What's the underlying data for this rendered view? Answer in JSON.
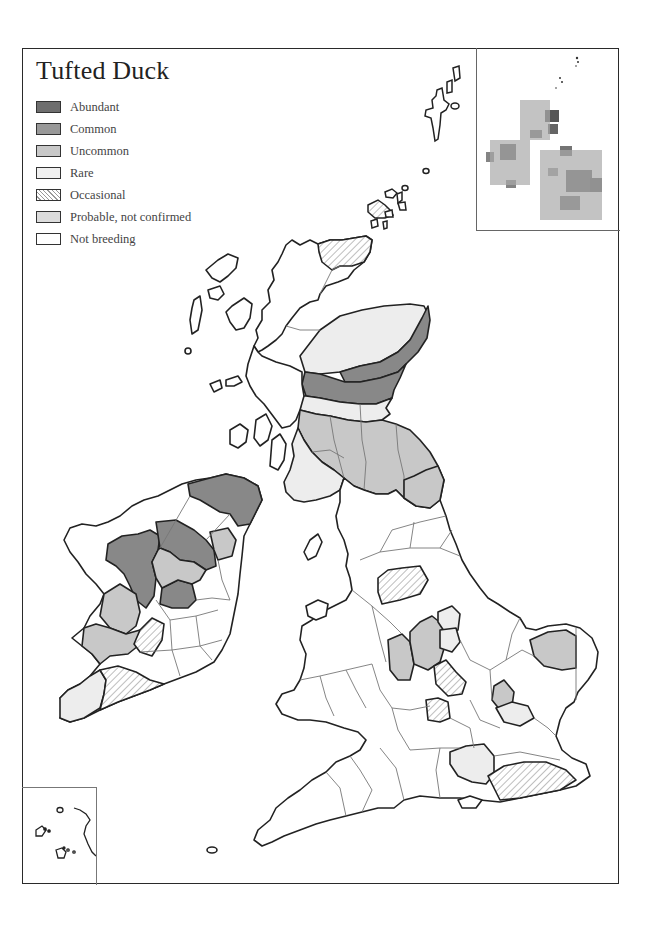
{
  "map": {
    "title": "Tufted Duck",
    "legend": [
      {
        "label": "Abundant",
        "key": "abundant",
        "color": "#6e6e6e"
      },
      {
        "label": "Common",
        "key": "common",
        "color": "#999999"
      },
      {
        "label": "Uncommon",
        "key": "uncommon",
        "color": "#c8c8c8"
      },
      {
        "label": "Rare",
        "key": "rare",
        "color": "#ededed"
      },
      {
        "label": "Occasional",
        "key": "occasional",
        "color": "hatched"
      },
      {
        "label": "Probable, not confirmed",
        "key": "probable",
        "color": "#dcdcdc"
      },
      {
        "label": "Not breeding",
        "key": "not_breeding",
        "color": "#ffffff"
      }
    ],
    "insets": {
      "top_right": "distribution dot map of Britain and Ireland",
      "bottom_left": "Scilly Isles / Channel coast detail"
    }
  }
}
